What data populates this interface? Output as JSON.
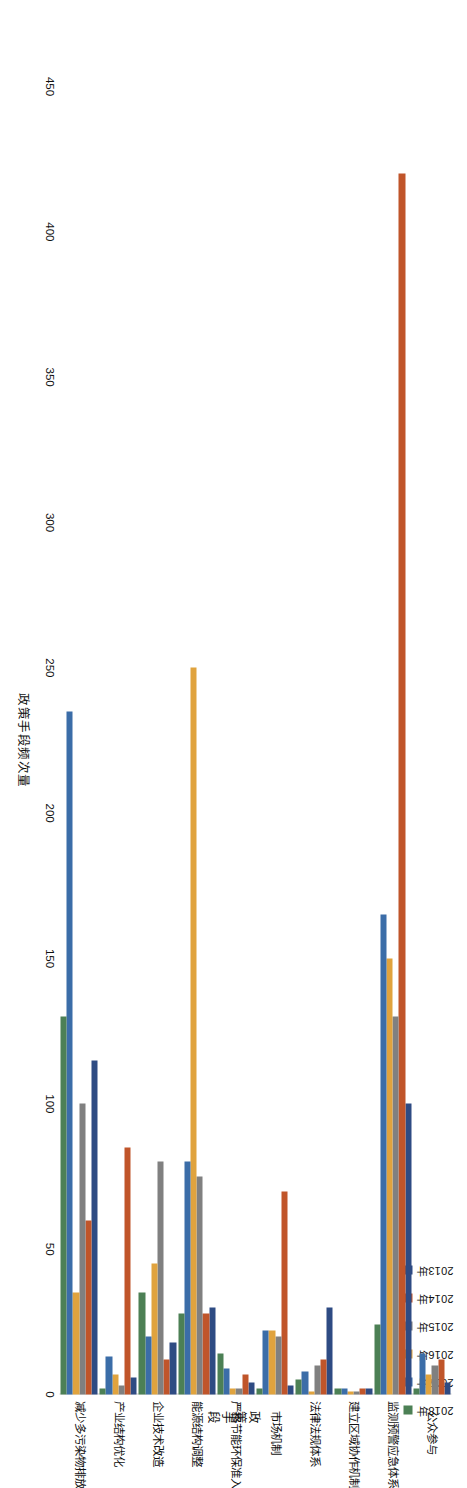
{
  "chart_data": {
    "type": "bar",
    "orientation": "horizontal",
    "title": "",
    "xlabel": "政策手段",
    "ylabel": "政策手段频次量",
    "ylim": [
      0,
      450
    ],
    "ticks": [
      "0",
      "50",
      "100",
      "150",
      "200",
      "250",
      "300",
      "350",
      "400",
      "450"
    ],
    "tick_values": [
      0,
      50,
      100,
      150,
      200,
      250,
      300,
      350,
      400,
      450
    ],
    "grid": false,
    "legend_position": "top-right",
    "categories": [
      "公众参与",
      "监测预警应急体系",
      "建立区域协作机制",
      "法律法规体系",
      "市场机制",
      "严格节能环保准入",
      "能源结构调整",
      "企业技术改造",
      "产业结构优化",
      "减少多污染物排放"
    ],
    "series": [
      {
        "name": "2013年",
        "color": "#2E4B83",
        "values": [
          4,
          100,
          2,
          30,
          3,
          4,
          30,
          18,
          6,
          115
        ]
      },
      {
        "name": "2014年",
        "color": "#C0552A",
        "values": [
          12,
          420,
          2,
          12,
          70,
          7,
          28,
          12,
          85,
          60
        ]
      },
      {
        "name": "2015年",
        "color": "#808080",
        "values": [
          10,
          130,
          1,
          10,
          20,
          2,
          75,
          80,
          3,
          100
        ]
      },
      {
        "name": "2016年",
        "color": "#E0A33E",
        "values": [
          7,
          150,
          1,
          1,
          22,
          2,
          250,
          45,
          7,
          35
        ]
      },
      {
        "name": "2017年",
        "color": "#3B6DA8",
        "values": [
          14,
          165,
          2,
          8,
          22,
          9,
          80,
          20,
          13,
          235
        ]
      },
      {
        "name": "2018年",
        "color": "#4C8055",
        "values": [
          2,
          24,
          2,
          5,
          2,
          14,
          28,
          35,
          2,
          130
        ]
      }
    ]
  },
  "legend": {
    "items": [
      {
        "label": "2013年",
        "color": "#2E4B83"
      },
      {
        "label": "2014年",
        "color": "#C0552A"
      },
      {
        "label": "2015年",
        "color": "#808080"
      },
      {
        "label": "2016年",
        "color": "#E0A33E"
      },
      {
        "label": "2017年",
        "color": "#3B6DA8"
      },
      {
        "label": "2018年",
        "color": "#4C8055"
      }
    ]
  }
}
